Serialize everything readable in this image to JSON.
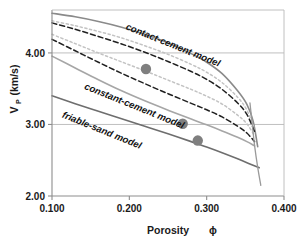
{
  "chart_data": {
    "type": "line",
    "title": "",
    "subtitle": "",
    "xlabel": "Porosity",
    "xlabel_symbol": "ϕ",
    "ylabel": "V",
    "ylabel_sub": "P",
    "ylabel_units": "(km/s)",
    "xlim": [
      0.1,
      0.4
    ],
    "ylim": [
      2.0,
      4.6
    ],
    "xticks": [
      0.1,
      0.2,
      0.3,
      0.4
    ],
    "xtick_labels": [
      "0.100",
      "0.200",
      "0.300",
      "0.400"
    ],
    "yticks": [
      2.0,
      3.0,
      4.0
    ],
    "ytick_labels": [
      "2.00",
      "3.00",
      "4.00"
    ],
    "grid": "horizontal-gridlines-at-3.00-and-4.00",
    "legend": "inline-curve-labels",
    "legend_position": "inline",
    "annotations": [
      {
        "text": "contact-cement model",
        "x": 0.255,
        "y": 4.07,
        "rotation": 22
      },
      {
        "text": "constant-cement model",
        "x": 0.205,
        "y": 3.22,
        "rotation": 22
      },
      {
        "text": "friable-sand model",
        "x": 0.163,
        "y": 2.88,
        "rotation": 22
      }
    ],
    "series": [
      {
        "name": "contact-cement model",
        "style": "solid",
        "color": "#8a8a8a",
        "width": 1.6,
        "x": [
          0.1,
          0.13,
          0.16,
          0.19,
          0.22,
          0.25,
          0.28,
          0.3,
          0.32,
          0.34,
          0.352,
          0.36,
          0.366
        ],
        "y": [
          4.555,
          4.505,
          4.44,
          4.36,
          4.26,
          4.14,
          3.99,
          3.87,
          3.71,
          3.47,
          3.28,
          3.05,
          2.69
        ]
      },
      {
        "name": "cement-upper-dotted",
        "style": "dotted",
        "color": "#c3c3c3",
        "width": 1.5,
        "x": [
          0.1,
          0.13,
          0.16,
          0.19,
          0.22,
          0.25,
          0.28,
          0.3,
          0.32,
          0.34,
          0.352,
          0.362
        ],
        "y": [
          4.45,
          4.38,
          4.3,
          4.21,
          4.1,
          3.98,
          3.84,
          3.73,
          3.585,
          3.38,
          3.2,
          2.93
        ]
      },
      {
        "name": "cement-upper-dashed",
        "style": "dashed",
        "color": "#202020",
        "width": 1.5,
        "x": [
          0.1,
          0.13,
          0.16,
          0.19,
          0.22,
          0.25,
          0.28,
          0.3,
          0.32,
          0.34,
          0.352,
          0.362
        ],
        "y": [
          4.42,
          4.33,
          4.23,
          4.125,
          4.01,
          3.88,
          3.74,
          3.63,
          3.49,
          3.3,
          3.14,
          2.9
        ]
      },
      {
        "name": "cement-mid-dotted",
        "style": "dotted",
        "color": "#c3c3c3",
        "width": 1.5,
        "x": [
          0.1,
          0.13,
          0.16,
          0.19,
          0.22,
          0.25,
          0.28,
          0.3,
          0.32,
          0.34,
          0.352,
          0.362
        ],
        "y": [
          4.26,
          4.13,
          4.0,
          3.875,
          3.75,
          3.62,
          3.49,
          3.395,
          3.285,
          3.13,
          3.01,
          2.84
        ]
      },
      {
        "name": "cement-lower-dashed",
        "style": "dashed",
        "color": "#202020",
        "width": 1.5,
        "x": [
          0.1,
          0.13,
          0.16,
          0.19,
          0.22,
          0.25,
          0.28,
          0.3,
          0.32,
          0.34,
          0.352,
          0.362
        ],
        "y": [
          4.19,
          4.03,
          3.87,
          3.715,
          3.57,
          3.43,
          3.295,
          3.205,
          3.105,
          2.975,
          2.88,
          2.76
        ]
      },
      {
        "name": "constant-cement model",
        "style": "solid",
        "color": "#a6a6a6",
        "width": 1.6,
        "x": [
          0.1,
          0.13,
          0.16,
          0.19,
          0.22,
          0.25,
          0.28,
          0.3,
          0.32,
          0.34,
          0.352,
          0.362
        ],
        "y": [
          3.955,
          3.79,
          3.625,
          3.47,
          3.33,
          3.2,
          3.075,
          2.995,
          2.91,
          2.82,
          2.76,
          2.7
        ]
      },
      {
        "name": "friable-sand model",
        "style": "solid",
        "color": "#6e6e6e",
        "width": 1.6,
        "x": [
          0.1,
          0.13,
          0.16,
          0.19,
          0.22,
          0.25,
          0.28,
          0.3,
          0.32,
          0.34,
          0.36,
          0.368
        ],
        "y": [
          3.4,
          3.29,
          3.185,
          3.08,
          2.975,
          2.87,
          2.76,
          2.685,
          2.605,
          2.52,
          2.43,
          2.395
        ]
      },
      {
        "name": "dry-rock-vertical-tail",
        "style": "solid",
        "color": "#9a9a9a",
        "width": 1.3,
        "x": [
          0.356,
          0.359,
          0.362,
          0.366,
          0.37
        ],
        "y": [
          3.3,
          3.0,
          2.7,
          2.4,
          2.15
        ]
      }
    ],
    "points": [
      {
        "label": "data-point-1",
        "x": 0.2215,
        "y": 3.775,
        "color": "#7f7f7f",
        "r": 5.2
      },
      {
        "label": "data-point-2",
        "x": 0.269,
        "y": 3.01,
        "color": "#7f7f7f",
        "r": 5.2
      },
      {
        "label": "data-point-3",
        "x": 0.2885,
        "y": 2.775,
        "color": "#7f7f7f",
        "r": 5.2
      }
    ],
    "axis_color": "#8d8d8d",
    "gridline_color": "#b9b9b9",
    "text_color": "#1a1a1a",
    "background": "#ffffff"
  }
}
